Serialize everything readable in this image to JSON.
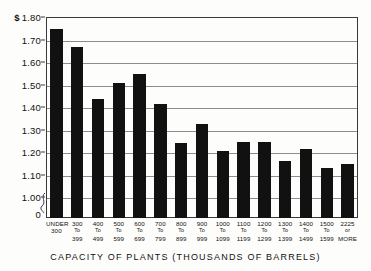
{
  "chart_data": {
    "type": "bar",
    "title": "",
    "xlabel": "CAPACITY OF PLANTS (THOUSANDS OF BARRELS)",
    "ylabel": "",
    "ylim": [
      1.0,
      1.8
    ],
    "y_axis_break": true,
    "y_axis_zero_label": "0",
    "y_currency_symbol": "$",
    "grid": true,
    "legend": "none",
    "yticks": [
      {
        "value": 1.8,
        "label": "1.80",
        "currency": true
      },
      {
        "value": 1.7,
        "label": "1.70",
        "currency": false
      },
      {
        "value": 1.6,
        "label": "1.60",
        "currency": false
      },
      {
        "value": 1.5,
        "label": "1.50",
        "currency": false
      },
      {
        "value": 1.4,
        "label": "1.40",
        "currency": false
      },
      {
        "value": 1.3,
        "label": "1.30",
        "currency": false
      },
      {
        "value": 1.2,
        "label": "1.20",
        "currency": false
      },
      {
        "value": 1.1,
        "label": "1.10",
        "currency": false
      },
      {
        "value": 1.0,
        "label": "1.00",
        "currency": false
      }
    ],
    "categories": [
      {
        "line1": "UNDER",
        "line2": "300"
      },
      {
        "line1": "300",
        "line2": "To",
        "line3": "399"
      },
      {
        "line1": "400",
        "line2": "To",
        "line3": "499"
      },
      {
        "line1": "500",
        "line2": "To",
        "line3": "599"
      },
      {
        "line1": "600",
        "line2": "To",
        "line3": "699"
      },
      {
        "line1": "700",
        "line2": "To",
        "line3": "799"
      },
      {
        "line1": "800",
        "line2": "To",
        "line3": "899"
      },
      {
        "line1": "900",
        "line2": "To",
        "line3": "999"
      },
      {
        "line1": "1000",
        "line2": "To",
        "line3": "1099"
      },
      {
        "line1": "1100",
        "line2": "To",
        "line3": "1199"
      },
      {
        "line1": "1200",
        "line2": "To",
        "line3": "1299"
      },
      {
        "line1": "1300",
        "line2": "To",
        "line3": "1399"
      },
      {
        "line1": "1400",
        "line2": "To",
        "line3": "1499"
      },
      {
        "line1": "1500",
        "line2": "To",
        "line3": "1599"
      },
      {
        "line1": "2225",
        "line2": "or",
        "line3": "MORE"
      }
    ],
    "values": [
      1.745,
      1.665,
      1.435,
      1.505,
      1.545,
      1.415,
      1.24,
      1.325,
      1.205,
      1.245,
      1.245,
      1.16,
      1.215,
      1.13,
      1.145
    ],
    "bar_color": "#111111"
  }
}
